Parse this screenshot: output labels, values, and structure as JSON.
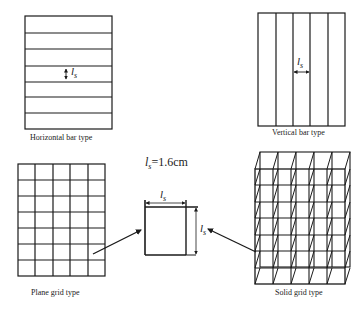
{
  "panels": {
    "horizontal_bar": {
      "caption": "Horizontal bar type",
      "symbol": "l",
      "symbol_sub": "s",
      "bar_count": 7
    },
    "vertical_bar": {
      "caption": "Vertical bar type",
      "symbol": "l",
      "symbol_sub": "s",
      "bar_count": 5
    },
    "plane_grid": {
      "caption": "Plane grid type",
      "columns": 5,
      "rows": 7
    },
    "solid_grid": {
      "caption": "Solid grid type",
      "columns": 5,
      "rows": 7
    }
  },
  "detail": {
    "formula_symbol": "l",
    "formula_sub": "s",
    "formula_value": "=1.6cm",
    "width_label": "l",
    "width_sub": "s",
    "height_label": "l",
    "height_sub": "s"
  },
  "colors": {
    "line": "#1a1a1a",
    "background": "#ffffff"
  }
}
